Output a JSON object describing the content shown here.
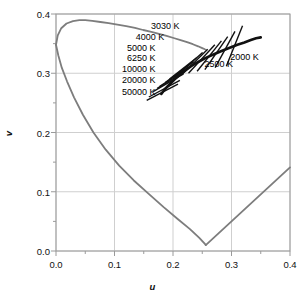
{
  "chart_data": {
    "type": "line",
    "title": "",
    "subtitle": "",
    "xlabel": "u",
    "ylabel": "v",
    "xlim": [
      0.0,
      0.4
    ],
    "ylim": [
      0.0,
      0.4
    ],
    "grid": true,
    "legend_position": "none",
    "x_ticks": [
      "0.0",
      "0.1",
      "0.2",
      "0.3",
      "0.4"
    ],
    "x_tick_values": [
      0.0,
      0.1,
      0.2,
      0.3,
      0.4
    ],
    "y_ticks": [
      "0.0",
      "0.1",
      "0.2",
      "0.3",
      "0.4"
    ],
    "y_tick_values": [
      0.0,
      0.1,
      0.2,
      0.3,
      0.4
    ],
    "minor_tick_step": 0.05,
    "series": [
      {
        "name": "spectral-locus",
        "color": "#7d7d7d",
        "u": [
          0.0,
          0.003,
          0.009,
          0.018,
          0.029,
          0.04,
          0.05,
          0.062,
          0.076,
          0.09,
          0.105,
          0.12,
          0.135,
          0.149,
          0.163,
          0.176,
          0.189,
          0.201,
          0.213,
          0.224,
          0.234,
          0.243,
          0.25,
          0.2545,
          0.256
        ],
        "v": [
          0.348,
          0.364,
          0.376,
          0.384,
          0.388,
          0.3895,
          0.3895,
          0.3885,
          0.3865,
          0.3845,
          0.382,
          0.3795,
          0.3765,
          0.373,
          0.37,
          0.3665,
          0.363,
          0.3595,
          0.356,
          0.3525,
          0.349,
          0.3455,
          0.3425,
          0.3405,
          0.34
        ]
      },
      {
        "name": "spectral-locus-lower",
        "color": "#7d7d7d",
        "u": [
          0.0,
          0.004,
          0.01,
          0.019,
          0.031,
          0.046,
          0.064,
          0.085,
          0.108,
          0.133,
          0.159,
          0.184,
          0.208,
          0.229,
          0.245,
          0.2545,
          0.256
        ],
        "v": [
          0.348,
          0.33,
          0.309,
          0.286,
          0.259,
          0.23,
          0.2,
          0.171,
          0.144,
          0.119,
          0.096,
          0.074,
          0.054,
          0.037,
          0.022,
          0.012,
          0.01
        ]
      },
      {
        "name": "purple-line",
        "color": "#7d7d7d",
        "u": [
          0.256,
          0.4
        ],
        "v": [
          0.01,
          0.141
        ]
      },
      {
        "name": "planckian-locus",
        "color": "#111111",
        "u": [
          0.18,
          0.186,
          0.194,
          0.202,
          0.211,
          0.22,
          0.231,
          0.243,
          0.256,
          0.27,
          0.284,
          0.297,
          0.31,
          0.322,
          0.333,
          0.342,
          0.35
        ],
        "v": [
          0.265,
          0.273,
          0.281,
          0.289,
          0.297,
          0.304,
          0.312,
          0.319,
          0.326,
          0.332,
          0.338,
          0.343,
          0.348,
          0.352,
          0.356,
          0.359,
          0.3605
        ]
      }
    ],
    "isotherms": [
      {
        "label": "50000 K",
        "u": 0.1818,
        "v": 0.268,
        "angle_deg": 27,
        "half_len": 0.03,
        "label_side": "left",
        "label_u": 0.17,
        "label_v": 0.269
      },
      {
        "label": "20000 K",
        "u": 0.1852,
        "v": 0.274,
        "angle_deg": 28,
        "half_len": 0.03,
        "label_side": "left",
        "label_u": 0.17,
        "label_v": 0.289
      },
      {
        "label": "10000 K",
        "u": 0.192,
        "v": 0.284,
        "angle_deg": 30,
        "half_len": 0.03,
        "label_side": "left",
        "label_u": 0.17,
        "label_v": 0.307
      },
      {
        "label": "6250 K",
        "u": 0.202,
        "v": 0.294,
        "angle_deg": 33,
        "half_len": 0.03,
        "label_side": "left",
        "label_u": 0.17,
        "label_v": 0.325
      },
      {
        "label": "5000 K",
        "u": 0.211,
        "v": 0.302,
        "angle_deg": 36,
        "half_len": 0.03,
        "label_side": "left",
        "label_u": 0.17,
        "label_v": 0.343
      },
      {
        "label": "4000 K",
        "u": 0.2265,
        "v": 0.314,
        "angle_deg": 41,
        "half_len": 0.032,
        "label_side": "left",
        "label_u": 0.185,
        "label_v": 0.361
      },
      {
        "label": "3030 K",
        "u": 0.249,
        "v": 0.324,
        "angle_deg": 47,
        "half_len": 0.033,
        "label_side": "left",
        "label_u": 0.211,
        "label_v": 0.379
      },
      {
        "label": "2500 K",
        "u": 0.274,
        "v": 0.334,
        "angle_deg": 55,
        "half_len": 0.034,
        "label_side": "right",
        "label_u": 0.254,
        "label_v": 0.316
      },
      {
        "label": "2000 K",
        "u": 0.305,
        "v": 0.346,
        "angle_deg": 68,
        "half_len": 0.037,
        "label_side": "right",
        "label_u": 0.298,
        "label_v": 0.327
      },
      {
        "label": "",
        "u": 0.197,
        "v": 0.289,
        "angle_deg": 31,
        "half_len": 0.028,
        "label_side": "left",
        "label_u": 0,
        "label_v": 0
      },
      {
        "label": "",
        "u": 0.217,
        "v": 0.308,
        "angle_deg": 38,
        "half_len": 0.029,
        "label_side": "left",
        "label_u": 0,
        "label_v": 0
      },
      {
        "label": "",
        "u": 0.237,
        "v": 0.319,
        "angle_deg": 44,
        "half_len": 0.031,
        "label_side": "left",
        "label_u": 0,
        "label_v": 0
      },
      {
        "label": "",
        "u": 0.262,
        "v": 0.329,
        "angle_deg": 51,
        "half_len": 0.033,
        "label_side": "left",
        "label_u": 0,
        "label_v": 0
      },
      {
        "label": "",
        "u": 0.289,
        "v": 0.34,
        "angle_deg": 61,
        "half_len": 0.035,
        "label_side": "left",
        "label_u": 0,
        "label_v": 0
      }
    ],
    "colors": {
      "grid": "#cfcfcf",
      "axis": "#9a9a9a",
      "spectral_locus": "#7d7d7d",
      "planckian_locus": "#111111",
      "isotherm": "#111111",
      "text": "#111111",
      "background": "#ffffff"
    }
  }
}
